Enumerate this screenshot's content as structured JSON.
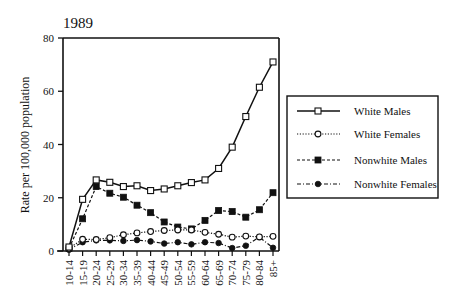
{
  "chart_data": {
    "type": "line",
    "title": "1989",
    "xlabel": "",
    "ylabel": "Rate per 100,000 population",
    "ylim": [
      0,
      80
    ],
    "yticks": [
      0,
      20,
      40,
      60,
      80
    ],
    "grid": false,
    "legend_position": "right",
    "categories": [
      "10-14",
      "15-19",
      "20-24",
      "25-29",
      "30-34",
      "35-39",
      "40-44",
      "45-49",
      "50-54",
      "55-59",
      "60-64",
      "65-69",
      "70-74",
      "75-79",
      "80-84",
      "85+"
    ],
    "series": [
      {
        "name": "White Males",
        "marker": "open-square",
        "line": "solid",
        "values": [
          1.5,
          19.4,
          26.7,
          25.8,
          24.2,
          24.5,
          22.7,
          23.3,
          24.5,
          25.7,
          26.7,
          31.0,
          39.0,
          50.5,
          61.5,
          71.0
        ]
      },
      {
        "name": "White Females",
        "marker": "open-circle",
        "line": "dotted",
        "values": [
          1.0,
          4.4,
          4.3,
          5.0,
          6.1,
          6.8,
          7.3,
          7.7,
          7.9,
          7.9,
          7.0,
          6.3,
          5.2,
          5.6,
          5.3,
          5.5
        ]
      },
      {
        "name": "Nonwhite Males",
        "marker": "filled-square",
        "line": "dashed",
        "values": [
          1.0,
          12.1,
          24.2,
          21.7,
          20.2,
          17.2,
          14.4,
          10.9,
          9.0,
          8.3,
          11.5,
          15.2,
          14.8,
          12.7,
          15.5,
          21.9
        ]
      },
      {
        "name": "Nonwhite Females",
        "marker": "filled-circle",
        "line": "dash-dot",
        "values": [
          0.5,
          3.3,
          4.0,
          4.0,
          3.8,
          4.1,
          3.6,
          2.8,
          3.3,
          2.5,
          3.3,
          3.0,
          1.1,
          2.0,
          5.2,
          1.2
        ]
      }
    ]
  },
  "colors": {
    "ink": "#111111",
    "background": "#ffffff"
  }
}
